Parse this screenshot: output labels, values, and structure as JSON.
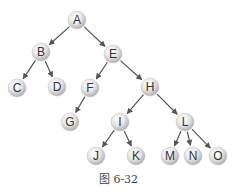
{
  "diagram": {
    "type": "tree",
    "caption": "图 6-32",
    "colors": {
      "node_fill_light": "#f4f4f4",
      "node_fill_dark": "#bdbdbd",
      "edge": "#555555",
      "text": "#333333"
    },
    "nodes": [
      {
        "id": "A",
        "label": "A",
        "x": 77,
        "y": 20
      },
      {
        "id": "B",
        "label": "B",
        "x": 41,
        "y": 52
      },
      {
        "id": "E",
        "label": "E",
        "x": 113,
        "y": 54
      },
      {
        "id": "C",
        "label": "C",
        "x": 17,
        "y": 88
      },
      {
        "id": "D",
        "label": "D",
        "x": 57,
        "y": 87
      },
      {
        "id": "F",
        "label": "F",
        "x": 90,
        "y": 88
      },
      {
        "id": "H",
        "label": "H",
        "x": 150,
        "y": 87
      },
      {
        "id": "G",
        "label": "G",
        "x": 70,
        "y": 122
      },
      {
        "id": "I",
        "label": "I",
        "x": 120,
        "y": 122
      },
      {
        "id": "L",
        "label": "L",
        "x": 185,
        "y": 122
      },
      {
        "id": "J",
        "label": "J",
        "x": 96,
        "y": 156
      },
      {
        "id": "K",
        "label": "K",
        "x": 136,
        "y": 156
      },
      {
        "id": "M",
        "label": "M",
        "x": 170,
        "y": 156
      },
      {
        "id": "N",
        "label": "N",
        "x": 193,
        "y": 156
      },
      {
        "id": "O",
        "label": "O",
        "x": 218,
        "y": 156
      }
    ],
    "edges": [
      [
        "A",
        "B"
      ],
      [
        "A",
        "E"
      ],
      [
        "B",
        "C"
      ],
      [
        "B",
        "D"
      ],
      [
        "E",
        "F"
      ],
      [
        "E",
        "H"
      ],
      [
        "F",
        "G"
      ],
      [
        "H",
        "I"
      ],
      [
        "H",
        "L"
      ],
      [
        "I",
        "J"
      ],
      [
        "I",
        "K"
      ],
      [
        "L",
        "M"
      ],
      [
        "L",
        "N"
      ],
      [
        "L",
        "O"
      ]
    ]
  }
}
